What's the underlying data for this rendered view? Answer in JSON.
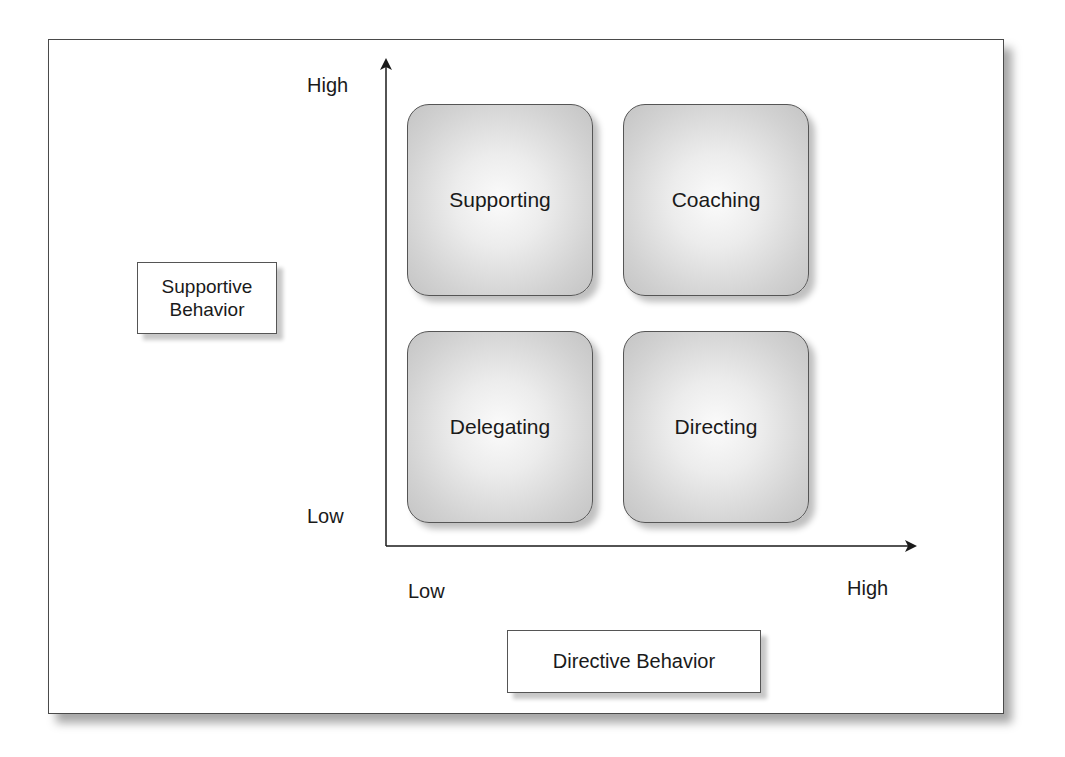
{
  "diagram": {
    "y_axis": {
      "label": "Supportive Behavior",
      "label_line1": "Supportive",
      "label_line2": "Behavior",
      "high": "High",
      "low": "Low"
    },
    "x_axis": {
      "label": "Directive Behavior",
      "high": "High",
      "low": "Low"
    },
    "quadrants": [
      {
        "position": "top-left",
        "label": "Supporting",
        "supportive": "High",
        "directive": "Low"
      },
      {
        "position": "top-right",
        "label": "Coaching",
        "supportive": "High",
        "directive": "High"
      },
      {
        "position": "bottom-left",
        "label": "Delegating",
        "supportive": "Low",
        "directive": "Low"
      },
      {
        "position": "bottom-right",
        "label": "Directing",
        "supportive": "Low",
        "directive": "High"
      }
    ],
    "colors": {
      "line": "#1a1a1a",
      "box_border": "#555555",
      "box_fill_center": "#fbfbfb",
      "box_fill_edge": "#c4c4c4"
    }
  }
}
